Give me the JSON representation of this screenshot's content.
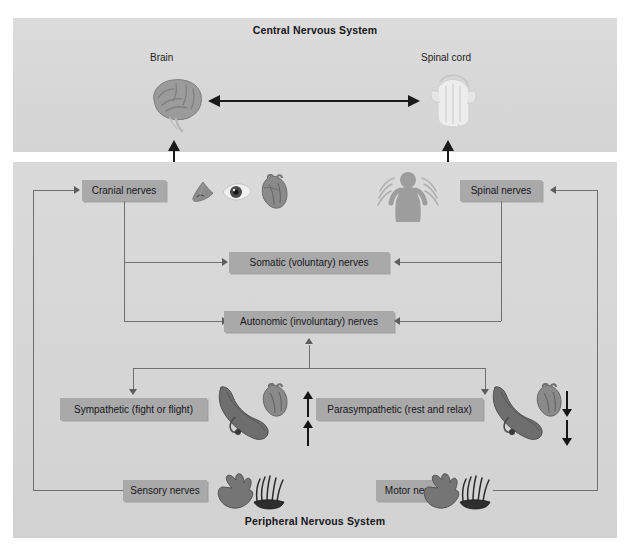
{
  "diagram": {
    "cns": {
      "title": "Central Nervous System",
      "nodes": [
        {
          "label": "Brain",
          "icon": "brain-icon"
        },
        {
          "label": "Spinal cord",
          "icon": "spinal-cord-icon"
        }
      ],
      "connector": "bidirectional-arrow"
    },
    "pns": {
      "title": "Peripheral Nervous System",
      "boxes": [
        {
          "id": "cranial-nerves",
          "label": "Cranial nerves"
        },
        {
          "id": "spinal-nerves",
          "label": "Spinal nerves"
        },
        {
          "id": "somatic-nerves",
          "label": "Somatic (voluntary) nerves"
        },
        {
          "id": "autonomic-nerves",
          "label": "Autonomic (involuntary) nerves"
        },
        {
          "id": "sympathetic",
          "label": "Sympathetic (fight or flight)"
        },
        {
          "id": "parasympathetic",
          "label": "Parasympathetic (rest and relax)"
        },
        {
          "id": "sensory-nerves",
          "label": "Sensory nerves"
        },
        {
          "id": "motor-nerves",
          "label": "Motor nerves"
        }
      ],
      "icons": [
        {
          "name": "nose-icon",
          "near": "cranial-nerves"
        },
        {
          "name": "eye-icon",
          "near": "cranial-nerves"
        },
        {
          "name": "heart-icon",
          "near": "cranial-nerves"
        },
        {
          "name": "torso-nerves-icon",
          "near": "spinal-nerves"
        },
        {
          "name": "lung-heart-icon",
          "near": "sympathetic"
        },
        {
          "name": "lung-heart-icon",
          "near": "parasympathetic"
        },
        {
          "name": "hand-hair-icon",
          "near": "sensory-nerves"
        },
        {
          "name": "hand-hair-icon",
          "near": "motor-nerves"
        }
      ],
      "indicators": [
        {
          "near": "sympathetic",
          "direction": "up",
          "count": 2
        },
        {
          "near": "parasympathetic",
          "direction": "down",
          "count": 2
        }
      ]
    },
    "colors": {
      "panel_background": "#d7d7d7",
      "box_fill": "#a9a9a9",
      "connector": "#6f6f6f",
      "text": "#16161a",
      "arrow_dark": "#151515"
    }
  }
}
